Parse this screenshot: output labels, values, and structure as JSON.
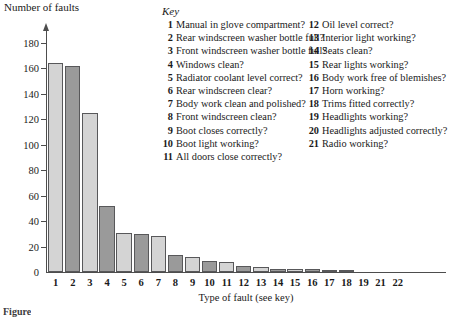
{
  "axis_titles": {
    "y": "Number of faults",
    "x": "Type of fault (see key)"
  },
  "key": {
    "title": "Key",
    "left_column": [
      {
        "num": "1",
        "text": "Manual in glove compartment?"
      },
      {
        "num": "2",
        "text": "Rear windscreen washer bottle full?"
      },
      {
        "num": "3",
        "text": "Front windscreen washer bottle full?"
      },
      {
        "num": "4",
        "text": "Windows clean?"
      },
      {
        "num": "5",
        "text": "Radiator coolant level correct?"
      },
      {
        "num": "6",
        "text": "Rear windscreen clear?"
      },
      {
        "num": "7",
        "text": "Body work clean and polished?"
      },
      {
        "num": "8",
        "text": "Front windscreen clean?"
      },
      {
        "num": "9",
        "text": "Boot closes correctly?"
      },
      {
        "num": "10",
        "text": "Boot light working?"
      },
      {
        "num": "11",
        "text": "All doors close correctly?"
      }
    ],
    "right_column": [
      {
        "num": "12",
        "text": "Oil level correct?"
      },
      {
        "num": "13",
        "text": "Interior light working?"
      },
      {
        "num": "14",
        "text": "Seats clean?"
      },
      {
        "num": "15",
        "text": "Rear lights working?"
      },
      {
        "num": "16",
        "text": "Body work free of blemishes?"
      },
      {
        "num": "17",
        "text": "Horn working?"
      },
      {
        "num": "18",
        "text": "Trims fitted correctly?"
      },
      {
        "num": "19",
        "text": "Headlights working?"
      },
      {
        "num": "20",
        "text": "Headlights adjusted correctly?"
      },
      {
        "num": "21",
        "text": "Radio working?"
      }
    ]
  },
  "caption": "Figure",
  "chart_data": {
    "type": "bar",
    "title": "",
    "xlabel": "Type of fault (see key)",
    "ylabel": "Number of faults",
    "ylim": [
      0,
      190
    ],
    "yticks": [
      0,
      20,
      40,
      60,
      80,
      100,
      120,
      140,
      160,
      180
    ],
    "grid": false,
    "legend": "none",
    "categories": [
      "1",
      "2",
      "3",
      "4",
      "5",
      "6",
      "7",
      "8",
      "9",
      "10",
      "11",
      "12",
      "13",
      "14",
      "15",
      "16",
      "17",
      "18",
      "19",
      "21",
      "22"
    ],
    "xtick_labels": [
      "1",
      "2",
      "3",
      "4",
      "5",
      "6",
      "7",
      "8",
      "9",
      "10",
      "11",
      "12",
      "13",
      "14",
      "15",
      "16",
      "17",
      "18",
      "19",
      "21",
      "22"
    ],
    "values": [
      164,
      162,
      125,
      52,
      31,
      30,
      28,
      13,
      12,
      9,
      8,
      5,
      4,
      2,
      2,
      2,
      1,
      1,
      0,
      0,
      0
    ],
    "bar_shading": [
      "light",
      "dark",
      "light",
      "dark",
      "light",
      "dark",
      "light",
      "dark",
      "light",
      "dark",
      "light",
      "dark",
      "light",
      "dark",
      "light",
      "dark",
      "light",
      "dark",
      "light",
      "dark",
      "light"
    ],
    "colors": {
      "light_bar": "#d4d4d4",
      "dark_bar": "#9a9a9a",
      "bar_outline": "#58585a",
      "axis": "#4d4d4d",
      "text": "#1a1a1a",
      "background": "#ffffff"
    }
  }
}
